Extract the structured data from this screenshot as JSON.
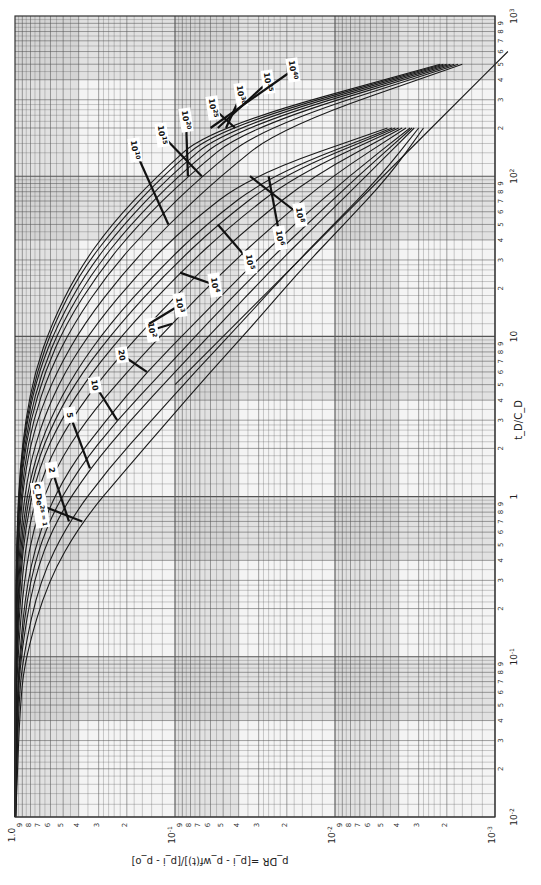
{
  "chart_data": {
    "type": "line",
    "title": "",
    "orientation_note": "figure printed rotated 90 degrees clockwise; p_DR axis runs along bottom, t_D/C_D axis along right side",
    "xlabel": "t_D/C_D",
    "ylabel": "p_DR = [p_i - p_wf(t)]/[p_i - p_o]",
    "xscale": "log",
    "yscale": "log",
    "xlim": [
      0.01,
      1000
    ],
    "ylim": [
      0.001,
      1.0
    ],
    "grid": true,
    "x_decade_labels": [
      "10^-2",
      "10^-1",
      "1",
      "10",
      "10^2",
      "10^3"
    ],
    "y_decade_labels": [
      "1.0",
      "10^-1",
      "10^-2",
      "10^-3"
    ],
    "minor_tick_labels": [
      "2",
      "3",
      "4",
      "5",
      "6",
      "7",
      "8",
      "9"
    ],
    "parameter_label": "C_D e^(2s)",
    "series": [
      {
        "name": "C_De^2s = 1",
        "x": [
          0.01,
          0.05,
          0.1,
          0.3,
          0.7,
          1.5,
          3,
          6,
          12,
          25,
          50,
          100,
          200
        ],
        "y": [
          0.99,
          0.93,
          0.86,
          0.62,
          0.38,
          0.2,
          0.11,
          0.06,
          0.032,
          0.017,
          0.0088,
          0.0046,
          0.0028
        ]
      },
      {
        "name": "2",
        "x": [
          0.01,
          0.05,
          0.1,
          0.3,
          0.7,
          1.5,
          3,
          6,
          12,
          25,
          50,
          100,
          200
        ],
        "y": [
          0.99,
          0.95,
          0.89,
          0.7,
          0.46,
          0.26,
          0.14,
          0.075,
          0.039,
          0.02,
          0.0102,
          0.0052,
          0.003
        ]
      },
      {
        "name": "5",
        "x": [
          0.01,
          0.05,
          0.1,
          0.3,
          0.7,
          1.5,
          3,
          6,
          12,
          25,
          50,
          100,
          200
        ],
        "y": [
          0.99,
          0.96,
          0.92,
          0.77,
          0.56,
          0.34,
          0.19,
          0.1,
          0.052,
          0.026,
          0.013,
          0.0064,
          0.0032
        ]
      },
      {
        "name": "10",
        "x": [
          0.01,
          0.05,
          0.1,
          0.3,
          0.7,
          1.5,
          3,
          6,
          12,
          25,
          50,
          100,
          200
        ],
        "y": [
          0.99,
          0.97,
          0.93,
          0.81,
          0.62,
          0.4,
          0.23,
          0.12,
          0.063,
          0.031,
          0.015,
          0.0072,
          0.0033
        ]
      },
      {
        "name": "20",
        "x": [
          0.01,
          0.05,
          0.1,
          0.3,
          0.7,
          1.5,
          3,
          6,
          12,
          25,
          50,
          100,
          200
        ],
        "y": [
          0.995,
          0.97,
          0.94,
          0.84,
          0.67,
          0.46,
          0.27,
          0.15,
          0.076,
          0.037,
          0.018,
          0.0082,
          0.0034
        ]
      },
      {
        "name": "10^2",
        "x": [
          0.01,
          0.05,
          0.1,
          0.3,
          0.7,
          1.5,
          3,
          6,
          12,
          25,
          50,
          100,
          200
        ],
        "y": [
          0.995,
          0.98,
          0.96,
          0.88,
          0.75,
          0.56,
          0.36,
          0.2,
          0.104,
          0.051,
          0.024,
          0.0105,
          0.0036
        ]
      },
      {
        "name": "10^3",
        "x": [
          0.01,
          0.05,
          0.1,
          0.3,
          0.7,
          1.5,
          3,
          6,
          12,
          25,
          50,
          100,
          200
        ],
        "y": [
          0.997,
          0.985,
          0.97,
          0.91,
          0.81,
          0.65,
          0.45,
          0.27,
          0.145,
          0.071,
          0.033,
          0.0138,
          0.0038
        ]
      },
      {
        "name": "10^4",
        "x": [
          0.01,
          0.05,
          0.1,
          0.3,
          0.7,
          1.5,
          3,
          6,
          12,
          25,
          50,
          100,
          200
        ],
        "y": [
          0.997,
          0.99,
          0.975,
          0.93,
          0.85,
          0.71,
          0.52,
          0.33,
          0.185,
          0.093,
          0.044,
          0.018,
          0.004
        ]
      },
      {
        "name": "10^5",
        "x": [
          0.01,
          0.05,
          0.1,
          0.3,
          0.7,
          1.5,
          3,
          6,
          12,
          25,
          50,
          100,
          200
        ],
        "y": [
          0.998,
          0.99,
          0.98,
          0.94,
          0.87,
          0.75,
          0.57,
          0.38,
          0.22,
          0.113,
          0.054,
          0.022,
          0.0042
        ]
      },
      {
        "name": "10^6",
        "x": [
          0.01,
          0.05,
          0.1,
          0.3,
          0.7,
          1.5,
          3,
          6,
          12,
          25,
          50,
          100,
          200
        ],
        "y": [
          0.998,
          0.99,
          0.98,
          0.95,
          0.89,
          0.78,
          0.61,
          0.42,
          0.255,
          0.132,
          0.064,
          0.026,
          0.0044
        ]
      },
      {
        "name": "10^8",
        "x": [
          0.01,
          0.05,
          0.1,
          0.3,
          0.7,
          1.5,
          3,
          6,
          12,
          25,
          50,
          100,
          200
        ],
        "y": [
          0.998,
          0.993,
          0.985,
          0.96,
          0.91,
          0.82,
          0.67,
          0.49,
          0.31,
          0.168,
          0.083,
          0.034,
          0.0047
        ]
      },
      {
        "name": "10^10",
        "x": [
          0.01,
          0.05,
          0.1,
          0.3,
          0.7,
          1.5,
          3,
          6,
          12,
          25,
          50,
          100,
          200,
          500
        ],
        "y": [
          0.999,
          0.995,
          0.99,
          0.97,
          0.93,
          0.86,
          0.73,
          0.55,
          0.37,
          0.21,
          0.11,
          0.052,
          0.022,
          0.0016
        ]
      },
      {
        "name": "10^15",
        "x": [
          0.01,
          0.05,
          0.1,
          0.3,
          0.7,
          1.5,
          3,
          6,
          12,
          25,
          50,
          100,
          200,
          500
        ],
        "y": [
          0.999,
          0.996,
          0.99,
          0.975,
          0.94,
          0.88,
          0.77,
          0.61,
          0.43,
          0.26,
          0.14,
          0.068,
          0.029,
          0.0017
        ]
      },
      {
        "name": "10^20",
        "x": [
          0.01,
          0.05,
          0.1,
          0.3,
          0.7,
          1.5,
          3,
          6,
          12,
          25,
          50,
          100,
          200,
          500
        ],
        "y": [
          0.999,
          0.996,
          0.992,
          0.978,
          0.95,
          0.9,
          0.8,
          0.65,
          0.48,
          0.3,
          0.17,
          0.083,
          0.036,
          0.0018
        ]
      },
      {
        "name": "10^25",
        "x": [
          0.01,
          0.05,
          0.1,
          0.3,
          0.7,
          1.5,
          3,
          6,
          12,
          25,
          50,
          100,
          200,
          500
        ],
        "y": [
          0.999,
          0.997,
          0.993,
          0.98,
          0.955,
          0.91,
          0.82,
          0.68,
          0.51,
          0.33,
          0.19,
          0.096,
          0.042,
          0.0019
        ]
      },
      {
        "name": "10^30",
        "x": [
          0.01,
          0.05,
          0.1,
          0.3,
          0.7,
          1.5,
          3,
          6,
          12,
          25,
          50,
          100,
          200,
          500
        ],
        "y": [
          0.999,
          0.997,
          0.994,
          0.982,
          0.96,
          0.92,
          0.84,
          0.71,
          0.54,
          0.36,
          0.21,
          0.108,
          0.048,
          0.002
        ]
      },
      {
        "name": "10^35",
        "x": [
          0.01,
          0.05,
          0.1,
          0.3,
          0.7,
          1.5,
          3,
          6,
          12,
          25,
          50,
          100,
          200,
          500
        ],
        "y": [
          0.999,
          0.997,
          0.995,
          0.984,
          0.963,
          0.925,
          0.85,
          0.73,
          0.57,
          0.39,
          0.23,
          0.12,
          0.054,
          0.0021
        ]
      },
      {
        "name": "10^40",
        "x": [
          0.01,
          0.05,
          0.1,
          0.3,
          0.7,
          1.5,
          3,
          6,
          12,
          25,
          50,
          100,
          200,
          500
        ],
        "y": [
          0.999,
          0.998,
          0.995,
          0.985,
          0.966,
          0.93,
          0.86,
          0.75,
          0.59,
          0.41,
          0.25,
          0.13,
          0.06,
          0.0022
        ]
      },
      {
        "name": "late-time asymptote",
        "x": [
          5,
          20,
          100,
          300,
          600
        ],
        "y": [
          0.1,
          0.025,
          0.005,
          0.00167,
          0.00083
        ]
      }
    ]
  },
  "labels": {
    "x_axis_title": "t_D/C_D",
    "y_axis_title": "p_DR =[p_i - p_wf(t)]/[p_i - p_o]",
    "curve_flags": [
      {
        "text": "C_De^2s = 1",
        "series": 0
      },
      {
        "text": "2",
        "series": 1
      },
      {
        "text": "5",
        "series": 2
      },
      {
        "text": "10",
        "series": 3
      },
      {
        "text": "20",
        "series": 4
      },
      {
        "text": "10^2",
        "series": 5
      },
      {
        "text": "10^3",
        "series": 6
      },
      {
        "text": "10^4",
        "series": 7
      },
      {
        "text": "10^5",
        "series": 8
      },
      {
        "text": "10^6",
        "series": 9
      },
      {
        "text": "10^8",
        "series": 10
      },
      {
        "text": "10^10",
        "series": 11
      },
      {
        "text": "10^15",
        "series": 12
      },
      {
        "text": "10^20",
        "series": 13
      },
      {
        "text": "10^25",
        "series": 14
      },
      {
        "text": "10^30",
        "series": 15
      },
      {
        "text": "10^35",
        "series": 16
      },
      {
        "text": "10^40",
        "series": 17
      }
    ]
  },
  "style": {
    "grid_color": "#555555",
    "band_color": "#bdbdbd",
    "curve_color": "#1a1a1a",
    "paper_color": "#f4f4f4"
  }
}
